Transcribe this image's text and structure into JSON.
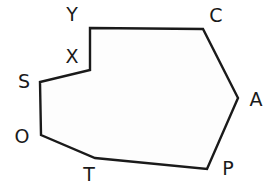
{
  "figure": {
    "type": "polygon-diagram",
    "shape_name": "octagon",
    "background_color": "#ffffff",
    "stroke_color": "#1a1a1a",
    "fill_color": "#fdfdfd",
    "stroke_width": 2.4,
    "label_color": "#1a1a1a",
    "label_font_size": 19,
    "vertex_count": 8,
    "vertices": [
      {
        "name": "Y",
        "x": 90,
        "y": 28,
        "label_x": 72,
        "label_y": 14
      },
      {
        "name": "C",
        "x": 203,
        "y": 29,
        "label_x": 216,
        "label_y": 15
      },
      {
        "name": "A",
        "x": 238,
        "y": 98,
        "label_x": 256,
        "label_y": 99
      },
      {
        "name": "P",
        "x": 207,
        "y": 169,
        "label_x": 228,
        "label_y": 168
      },
      {
        "name": "T",
        "x": 95,
        "y": 158,
        "label_x": 89,
        "label_y": 174
      },
      {
        "name": "O",
        "x": 41,
        "y": 135,
        "label_x": 22,
        "label_y": 136
      },
      {
        "name": "S",
        "x": 40,
        "y": 82,
        "label_x": 24,
        "label_y": 81
      },
      {
        "name": "X",
        "x": 90,
        "y": 70,
        "label_x": 72,
        "label_y": 56
      }
    ],
    "edges": [
      {
        "from": "Y",
        "to": "C"
      },
      {
        "from": "C",
        "to": "A"
      },
      {
        "from": "A",
        "to": "P"
      },
      {
        "from": "P",
        "to": "T"
      },
      {
        "from": "T",
        "to": "O"
      },
      {
        "from": "O",
        "to": "S"
      },
      {
        "from": "S",
        "to": "X"
      },
      {
        "from": "X",
        "to": "Y"
      }
    ],
    "path_points": "90,28 203,29 238,98 207,169 95,158 41,135 40,82 90,70"
  }
}
